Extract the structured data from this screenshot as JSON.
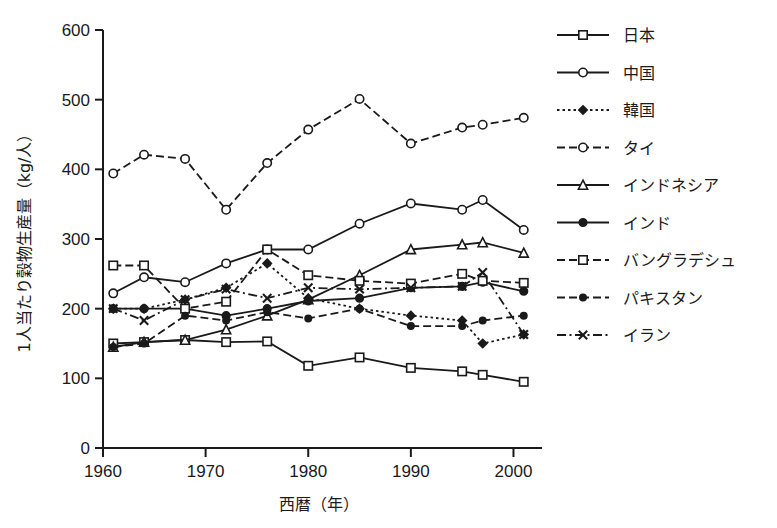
{
  "chart_data": {
    "type": "line",
    "title": "",
    "xlabel": "西暦（年）",
    "ylabel": "1人当たり穀物生産量（kg/人）",
    "xlim": [
      1960,
      2002
    ],
    "ylim": [
      0,
      600
    ],
    "xticks": [
      1960,
      1970,
      1980,
      1990,
      2000
    ],
    "yticks": [
      0,
      100,
      200,
      300,
      400,
      500,
      600
    ],
    "grid": false,
    "legend_position": "right",
    "x": [
      1961,
      1964,
      1968,
      1972,
      1976,
      1980,
      1985,
      1990,
      1995,
      1997,
      2001
    ],
    "series": [
      {
        "name": "日本",
        "marker": "open-square",
        "dash": "solid",
        "values": [
          150,
          152,
          155,
          152,
          153,
          118,
          130,
          115,
          110,
          105,
          95
        ]
      },
      {
        "name": "中国",
        "marker": "open-circle",
        "dash": "solid",
        "values": [
          222,
          245,
          238,
          265,
          285,
          285,
          322,
          351,
          342,
          356,
          313
        ]
      },
      {
        "name": "韓国",
        "marker": "filled-diamond",
        "dash": "dotted",
        "values": [
          200,
          200,
          213,
          230,
          265,
          215,
          200,
          190,
          183,
          150,
          163
        ]
      },
      {
        "name": "タイ",
        "marker": "open-circle",
        "dash": "dashed",
        "values": [
          394,
          421,
          415,
          342,
          409,
          457,
          501,
          437,
          460,
          464,
          474
        ]
      },
      {
        "name": "インドネシア",
        "marker": "open-triangle",
        "dash": "solid",
        "values": [
          145,
          152,
          155,
          170,
          190,
          213,
          248,
          285,
          292,
          295,
          280
        ]
      },
      {
        "name": "インド",
        "marker": "filled-circle",
        "dash": "solid",
        "values": [
          200,
          200,
          200,
          190,
          200,
          211,
          215,
          230,
          232,
          238,
          225
        ]
      },
      {
        "name": "バングラデシュ",
        "marker": "open-square",
        "dash": "dashed",
        "values": [
          262,
          262,
          200,
          210,
          285,
          248,
          240,
          236,
          250,
          240,
          237
        ]
      },
      {
        "name": "パキスタン",
        "marker": "filled-circle-small",
        "dash": "dashed",
        "values": [
          145,
          150,
          190,
          183,
          195,
          186,
          200,
          175,
          175,
          183,
          190
        ]
      },
      {
        "name": "イラン",
        "marker": "cross",
        "dash": "dash-dot",
        "values": [
          200,
          183,
          213,
          228,
          215,
          230,
          228,
          230,
          232,
          252,
          163
        ]
      }
    ]
  },
  "axis": {
    "y_tick_labels": [
      "600",
      "500",
      "400",
      "300",
      "200",
      "100",
      "0"
    ],
    "x_tick_labels": [
      "1960",
      "1970",
      "1980",
      "1990",
      "2000"
    ]
  },
  "legend": {
    "items": [
      {
        "label": "日本"
      },
      {
        "label": "中国"
      },
      {
        "label": "韓国"
      },
      {
        "label": "タイ"
      },
      {
        "label": "インドネシア"
      },
      {
        "label": "インド"
      },
      {
        "label": "バングラデシュ"
      },
      {
        "label": "パキスタン"
      },
      {
        "label": "イラン"
      }
    ]
  },
  "colors": {
    "ink": "#1a1a1a",
    "background": "#ffffff"
  }
}
